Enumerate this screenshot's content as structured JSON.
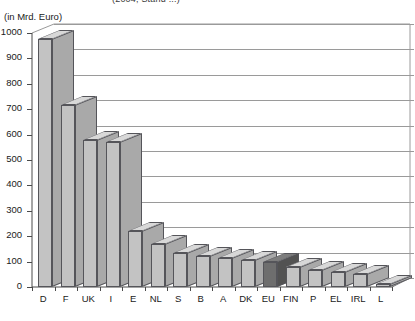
{
  "figure": {
    "title_fragment": "(2004, Stand ...)",
    "unit_label": "(in Mrd. Euro)"
  },
  "colors": {
    "bar_front": "#c3c3c3",
    "bar_side": "#a9a9a9",
    "bar_top": "#d8d8d8",
    "bar_outline": "#55555a",
    "highlight_front": "#6e6e6e",
    "highlight_side": "#525252",
    "highlight_top": "#7d7d7d",
    "gridline": "#9a9a9a",
    "axis": "#4a4a4a",
    "background": "#ffffff",
    "text": "#1a1a1a"
  },
  "chart_data": {
    "type": "bar",
    "title": "(in Mrd. Euro)",
    "subtitle": "",
    "xlabel": "",
    "ylabel": "",
    "ylim": [
      0,
      1000
    ],
    "ytick_step": 100,
    "ytick_labels": [
      "0",
      "100",
      "200",
      "300",
      "400",
      "500",
      "600",
      "700",
      "800",
      "900",
      "1000"
    ],
    "grid": true,
    "legend": false,
    "legend_position": "none",
    "three_d": true,
    "highlight_category": "EU",
    "categories": [
      "D",
      "F",
      "UK",
      "I",
      "E",
      "NL",
      "S",
      "B",
      "A",
      "DK",
      "EU",
      "FIN",
      "P",
      "EL",
      "IRL",
      "L"
    ],
    "values": [
      975,
      715,
      580,
      570,
      220,
      170,
      135,
      122,
      115,
      107,
      100,
      80,
      67,
      60,
      50,
      12
    ]
  }
}
